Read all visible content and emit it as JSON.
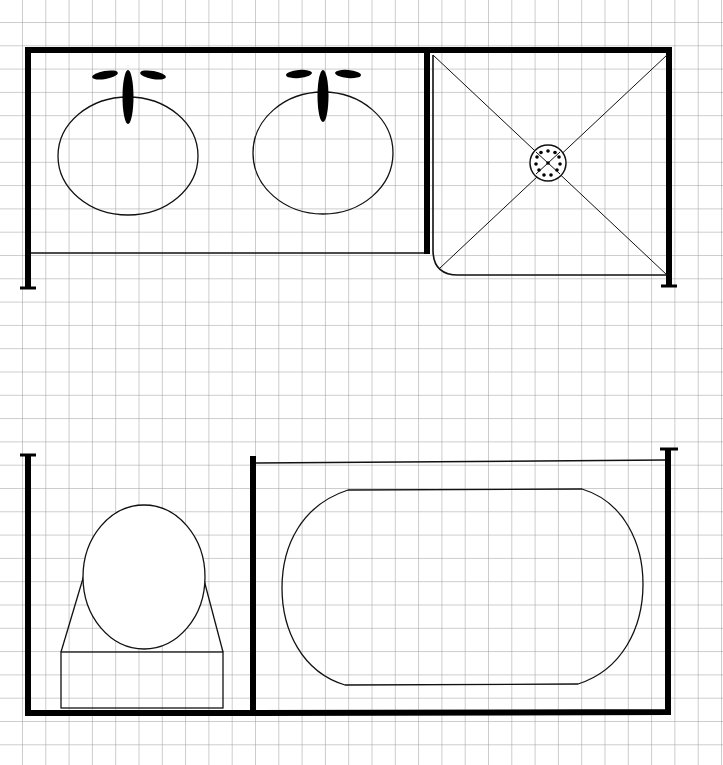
{
  "diagram": {
    "type": "floor-plan",
    "background": "#ffffff",
    "grid": {
      "spacing_px": 23.3,
      "offset_x": 22,
      "offset_y": 22,
      "color": "#9a9a9a"
    },
    "wall_color": "#000000",
    "line_color": "#111111",
    "fixtures": [
      {
        "id": "sink-1",
        "label": "Sink",
        "icon": "sink-icon"
      },
      {
        "id": "sink-2",
        "label": "Sink",
        "icon": "sink-icon"
      },
      {
        "id": "shower",
        "label": "Shower with center drain",
        "icon": "shower-drain-icon"
      },
      {
        "id": "toilet",
        "label": "Toilet",
        "icon": "toilet-icon"
      },
      {
        "id": "bathtub",
        "label": "Bathtub",
        "icon": "bathtub-icon"
      }
    ],
    "areas": [
      {
        "id": "vanity",
        "label": "Double vanity"
      },
      {
        "id": "shower-stall",
        "label": "Shower stall"
      },
      {
        "id": "toilet-nook",
        "label": "Toilet nook"
      },
      {
        "id": "tub-alcove",
        "label": "Tub alcove"
      }
    ]
  }
}
